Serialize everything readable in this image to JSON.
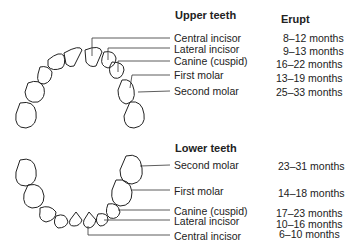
{
  "upper": {
    "heading": "Upper teeth",
    "erupt_heading": "Erupt",
    "teeth": [
      {
        "name": "Central incisor",
        "erupt": "8–12 months"
      },
      {
        "name": "Lateral incisor",
        "erupt": "9–13 months"
      },
      {
        "name": "Canine (cuspid)",
        "erupt": "16–22 months"
      },
      {
        "name": "First molar",
        "erupt": "13–19 months"
      },
      {
        "name": "Second molar",
        "erupt": "25–33 months"
      }
    ]
  },
  "lower": {
    "heading": "Lower teeth",
    "teeth": [
      {
        "name": "Second molar",
        "erupt": "23–31 months"
      },
      {
        "name": "First molar",
        "erupt": "14–18 months"
      },
      {
        "name": "Canine (cuspid)",
        "erupt": "17–23 months"
      },
      {
        "name": "Lateral incisor",
        "erupt": "10–16 months"
      },
      {
        "name": "Central incisor",
        "erupt": "6–10 months"
      }
    ]
  }
}
